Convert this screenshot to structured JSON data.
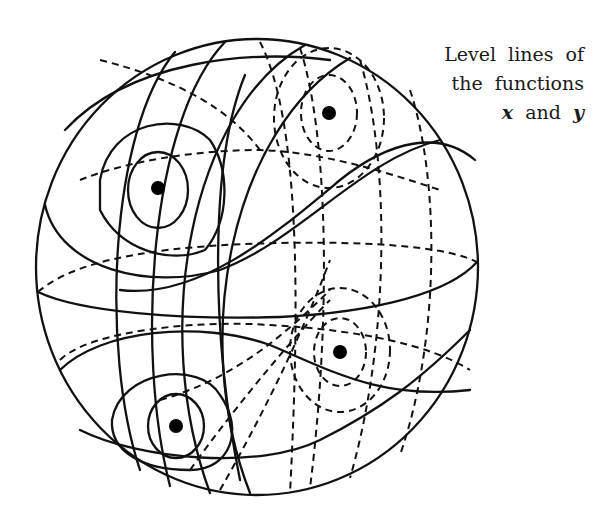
{
  "caption": {
    "line1": "Level lines of",
    "line2": "the functions",
    "line3_var1": "x",
    "line3_and": "and",
    "line3_var2": "y"
  },
  "figure": {
    "sphere": {
      "cx": 257,
      "cy": 267,
      "rx": 221,
      "ry": 228
    },
    "critical_points": [
      {
        "label": "front-upper",
        "cx": 158,
        "cy": 188
      },
      {
        "label": "back-upper",
        "cx": 329,
        "cy": 113
      },
      {
        "label": "back-lower",
        "cx": 340,
        "cy": 352
      },
      {
        "label": "front-lower",
        "cx": 176,
        "cy": 426
      }
    ],
    "line_styles": {
      "visible": "solid",
      "hidden": "dashed"
    },
    "colors": {
      "ink": "#111111",
      "background": "#ffffff"
    }
  }
}
